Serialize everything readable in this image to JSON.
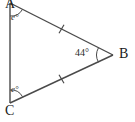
{
  "figure": {
    "type": "geometry-diagram",
    "shape": "triangle",
    "background_color": "#ffffff",
    "stroke_color": "#4a4a4a",
    "text_color": "#1a1a1a"
  },
  "vertices": {
    "a": {
      "label": "A",
      "x": 10,
      "y": 3
    },
    "b": {
      "label": "B",
      "x": 113,
      "y": 55
    },
    "c": {
      "label": "C",
      "x": 10,
      "y": 103
    }
  },
  "angles": {
    "at_a": {
      "label": "e°",
      "is_variable": true
    },
    "at_b": {
      "label": "44°",
      "is_variable": false
    },
    "at_c": {
      "label": "e°",
      "is_variable": true
    }
  },
  "sides": {
    "ab": {
      "tick_marks": 1
    },
    "cb": {
      "tick_marks": 1
    },
    "ac": {
      "tick_marks": 0
    }
  }
}
